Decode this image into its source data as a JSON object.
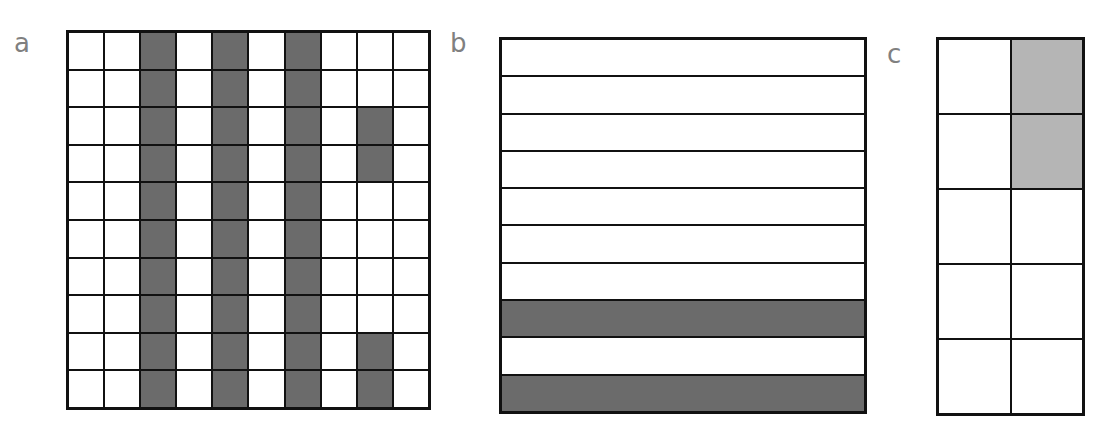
{
  "panels": [
    {
      "label": "a",
      "rows": 10,
      "cols": 10,
      "shaded_cells": [
        [
          1,
          3
        ],
        [
          1,
          5
        ],
        [
          1,
          7
        ],
        [
          2,
          3
        ],
        [
          2,
          5
        ],
        [
          2,
          7
        ],
        [
          3,
          3
        ],
        [
          3,
          5
        ],
        [
          3,
          7
        ],
        [
          3,
          9
        ],
        [
          4,
          3
        ],
        [
          4,
          5
        ],
        [
          4,
          7
        ],
        [
          4,
          9
        ],
        [
          5,
          3
        ],
        [
          5,
          5
        ],
        [
          5,
          7
        ],
        [
          6,
          3
        ],
        [
          6,
          5
        ],
        [
          6,
          7
        ],
        [
          7,
          3
        ],
        [
          7,
          5
        ],
        [
          7,
          7
        ],
        [
          8,
          3
        ],
        [
          8,
          5
        ],
        [
          8,
          7
        ],
        [
          9,
          3
        ],
        [
          9,
          5
        ],
        [
          9,
          7
        ],
        [
          9,
          9
        ],
        [
          10,
          3
        ],
        [
          10,
          5
        ],
        [
          10,
          7
        ],
        [
          10,
          9
        ]
      ],
      "shade_color": "#6b6b6b",
      "shaded_count": 34,
      "total_cells": 100
    },
    {
      "label": "b",
      "rows": 10,
      "cols": 1,
      "shaded_cells": [
        [
          8,
          1
        ],
        [
          10,
          1
        ]
      ],
      "shade_color": "#6b6b6b",
      "shaded_count": 2,
      "total_cells": 10
    },
    {
      "label": "c",
      "rows": 5,
      "cols": 2,
      "shaded_cells": [
        [
          1,
          2
        ],
        [
          2,
          2
        ]
      ],
      "shade_color": "#b5b5b5",
      "shaded_count": 2,
      "total_cells": 10
    }
  ],
  "colors": {
    "dark_shade": "#6b6b6b",
    "light_shade": "#b5b5b5",
    "grid_line": "#111111",
    "label": "#808080"
  }
}
